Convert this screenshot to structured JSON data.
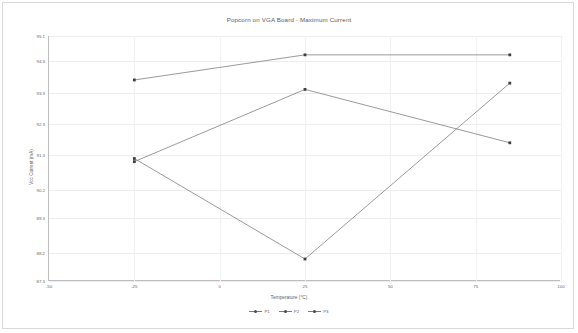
{
  "chart_data": {
    "type": "line",
    "title": "Popcorn on VGA Board - Maximum Current",
    "xlabel": "Temperature (°C)",
    "ylabel": "Vcc Current (mA)",
    "xlim": [
      -50,
      100
    ],
    "ylim": [
      87.3,
      95.1
    ],
    "xticks": [
      -50,
      -25,
      0,
      25,
      50,
      75,
      100
    ],
    "xticklabels": [
      "-50",
      "-25",
      "0",
      "25",
      "50",
      "75",
      "100"
    ],
    "yticks": [
      87.3,
      88.2,
      89.3,
      90.2,
      91.3,
      92.3,
      93.3,
      94.3,
      95.1
    ],
    "yticklabels": [
      "87.3",
      "88.2",
      "89.3",
      "90.2",
      "91.3",
      "92.3",
      "93.3",
      "94.3",
      "95.1"
    ],
    "grid": true,
    "legend_position": "bottom",
    "x": [
      -25,
      25,
      85
    ],
    "series": [
      {
        "name": "P1",
        "values": [
          91.2,
          88.0,
          93.6
        ]
      },
      {
        "name": "P2",
        "values": [
          93.7,
          94.5,
          94.5
        ]
      },
      {
        "name": "P3",
        "values": [
          91.1,
          93.4,
          91.7
        ]
      }
    ]
  },
  "style": {
    "line_color": "#6f6f6f",
    "marker_color": "#3f3f3f",
    "grid_color": "#ededed",
    "axis_color": "#bdbdbd",
    "text_color": "#5f5f5f",
    "background": "#ffffff"
  }
}
